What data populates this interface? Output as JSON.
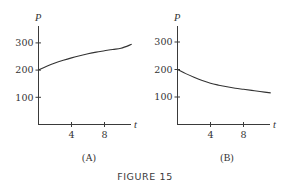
{
  "figure": {
    "caption": "FIGURE 15",
    "panels": [
      {
        "label": "(A)",
        "xlabel": "t",
        "ylabel": "P",
        "xticks": [
          "4",
          "8"
        ],
        "yticks": [
          "100",
          "200",
          "300"
        ]
      },
      {
        "label": "(B)",
        "xlabel": "t",
        "ylabel": "P",
        "xticks": [
          "4",
          "8"
        ],
        "yticks": [
          "100",
          "200",
          "300"
        ]
      }
    ]
  },
  "colors": {
    "axis": "#3a3a3a",
    "curve": "#333333",
    "text": "#333333"
  },
  "chart_data": [
    {
      "type": "line",
      "title": "(A)",
      "xlabel": "t",
      "ylabel": "P",
      "xticks": [
        4,
        8
      ],
      "yticks": [
        100,
        200,
        300
      ],
      "xlim": [
        0,
        11.5
      ],
      "ylim": [
        0,
        360
      ],
      "grid": false,
      "series": [
        {
          "name": "P(t) increasing toward 300",
          "x": [
            0,
            1,
            2,
            3,
            4,
            5,
            6,
            7,
            8,
            9,
            10,
            11.3
          ],
          "values": [
            200,
            214,
            226,
            236,
            245,
            253,
            260,
            266,
            271,
            276,
            280,
            295
          ]
        }
      ]
    },
    {
      "type": "line",
      "title": "(B)",
      "xlabel": "t",
      "ylabel": "P",
      "xticks": [
        4,
        8
      ],
      "yticks": [
        100,
        200,
        300
      ],
      "xlim": [
        0,
        11.5
      ],
      "ylim": [
        0,
        360
      ],
      "grid": false,
      "series": [
        {
          "name": "P(t) decreasing toward ~100",
          "x": [
            0,
            1,
            2,
            3,
            4,
            5,
            6,
            7,
            8,
            9,
            10,
            11.3
          ],
          "values": [
            200,
            185,
            172,
            160,
            150,
            143,
            137,
            132,
            128,
            124,
            120,
            115
          ]
        }
      ]
    }
  ]
}
